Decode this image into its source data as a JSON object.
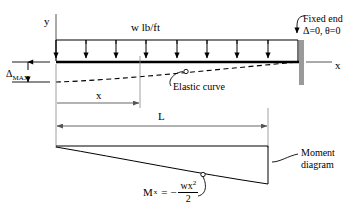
{
  "figure": {
    "type": "cantilever-beam-diagram"
  },
  "labels": {
    "y_axis": "y",
    "x_axis": "x",
    "load": "w lb/ft",
    "fixed_end_line1": "Fixed end",
    "fixed_end_line2": "Δ=0,  θ=0",
    "elastic_curve": "Elastic curve",
    "delta_max": "Δ",
    "delta_max_sub": "MAX",
    "x_dimension": "x",
    "length_dimension": "L",
    "moment_line1": "Moment",
    "moment_line2": "diagram"
  },
  "formula": {
    "symbol": "M",
    "symbol_sub": "x",
    "equals": "= −",
    "numerator": "wx",
    "numerator_sup": "2",
    "denominator": "2"
  },
  "geometry": {
    "beam_left_x": 56,
    "beam_right_x": 298,
    "beam_top_y": 40,
    "beam_bottom_y": 62,
    "load_arrow_count": 8,
    "wall_x": 300,
    "wall_top_y": 40,
    "wall_bottom_y": 85,
    "x_dim_end": 140,
    "moment_top_y": 146,
    "moment_right_y": 184,
    "delta_max_value_y": 82
  },
  "colors": {
    "line": "#000000",
    "wall": "#9a9a9a",
    "thin": "#6d6d6d",
    "background": "#ffffff"
  }
}
